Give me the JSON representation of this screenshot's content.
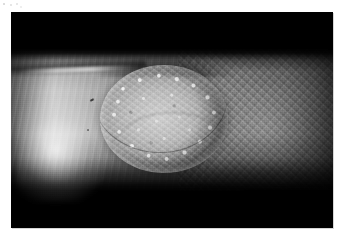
{
  "document": {
    "type": "clinical-photograph",
    "background_color": "#ffffff"
  },
  "photograph": {
    "name": "clinical-skin-lesion-photo",
    "modality": "grayscale-photograph",
    "subject": "skin of limb (forearm) with single raised circular lesion",
    "frame": {
      "x": 11,
      "y": 12,
      "width": 322,
      "height": 216,
      "background_color": "#000000"
    },
    "colors": {
      "page": "#ffffff",
      "frame_background": "#000000",
      "skin_brightest": "#cfcfcf",
      "skin_mid": "#949494",
      "skin_dark": "#2e2e2e",
      "lesion_body": "#c4c4c4",
      "lesion_granule_highlight": "#ffffff",
      "lesion_rim_shadow": "#000000"
    },
    "regions": {
      "dark_top_band": "upper ~20% of frame is near-black background",
      "skin_band": "horizontal band of illuminated skin across middle ~65% of frame",
      "specular_highlight": "bright specular highlight on lower-left of skin band",
      "skin_striations": "fine vertical striations across left half of skin",
      "skin_mottling": "fine mottled texture across right half of skin",
      "dark_bottom_band": "lower ~20% of frame is near-black background"
    },
    "lesion": {
      "name": "skin-lesion",
      "shape": "oval / circular plaque",
      "center_x_pct": 47.5,
      "center_y_pct": 49.5,
      "width_pct": 40,
      "height_pct": 50,
      "surface": "granular papillomatous, bright speckled keratotic surface",
      "rim": "bright keratotic granules concentrated around the border with dark shadow arc above"
    },
    "marks": [
      {
        "name": "skin-fleck",
        "description": "small dark linear fleck on left skin"
      },
      {
        "name": "skin-fleck-secondary",
        "description": "tiny dark dot on left skin"
      }
    ]
  }
}
